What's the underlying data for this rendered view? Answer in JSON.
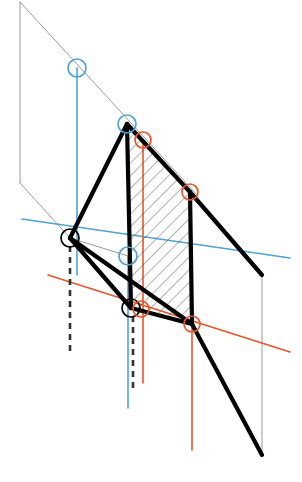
{
  "canvas": {
    "width": 302,
    "height": 482,
    "background": "#ffffff",
    "title": "Descriptive geometry projection diagram"
  },
  "palette": {
    "black": "#000000",
    "gray": "#808080",
    "blue": "#4da3d6",
    "orange": "#e8552a",
    "hatch": "#555555",
    "white": "#ffffff"
  },
  "strokes": {
    "thick": 4.2,
    "medium": 1.6,
    "thin": 1.0,
    "hairline": 0.8,
    "dashed_width": 2.6,
    "dash_pattern": "6 5"
  },
  "chart_data": {
    "type": "scatter",
    "xlabel": "",
    "ylabel": "",
    "xlim": [
      0,
      302
    ],
    "ylim": [
      0,
      482
    ],
    "grid": false,
    "legend": false,
    "markers": [
      {
        "id": "m1",
        "label": "blue-node-upper",
        "color": "#4da3d6",
        "x": 77,
        "y": 68,
        "r": 9
      },
      {
        "id": "m2",
        "label": "blue-node-quad-top-left",
        "color": "#4da3d6",
        "x": 127,
        "y": 124,
        "r": 9
      },
      {
        "id": "m3",
        "label": "orange-node-upper",
        "color": "#e8552a",
        "x": 143,
        "y": 140,
        "r": 8
      },
      {
        "id": "m4",
        "label": "orange-node-quad-top-right",
        "color": "#e8552a",
        "x": 190,
        "y": 192,
        "r": 8
      },
      {
        "id": "m5",
        "label": "black-node-apex-left",
        "color": "#000000",
        "x": 70,
        "y": 238,
        "r": 9
      },
      {
        "id": "m6",
        "label": "blue-node-mid",
        "color": "#4da3d6",
        "x": 128,
        "y": 256,
        "r": 9
      },
      {
        "id": "m7",
        "label": "black-node-lower-left",
        "color": "#000000",
        "x": 131,
        "y": 308,
        "r": 9
      },
      {
        "id": "m8",
        "label": "orange-node-lower-left",
        "color": "#e8552a",
        "x": 141,
        "y": 309,
        "r": 8
      },
      {
        "id": "m9",
        "label": "orange-node-quad-bottom-right",
        "color": "#e8552a",
        "x": 192,
        "y": 324,
        "r": 8
      }
    ],
    "quad_face": {
      "label": "hatched-quadrilateral-face",
      "points": "127,124 190,192 192,324 131,308",
      "hatch_angle_deg": 45,
      "hatch_spacing": 9
    },
    "thick_lines": [
      {
        "id": "t1",
        "label": "quad-edge-left",
        "x1": 127,
        "y1": 124,
        "x2": 131,
        "y2": 308
      },
      {
        "id": "t2",
        "label": "quad-edge-top",
        "x1": 127,
        "y1": 124,
        "x2": 190,
        "y2": 192
      },
      {
        "id": "t3",
        "label": "quad-edge-right",
        "x1": 190,
        "y1": 192,
        "x2": 192,
        "y2": 324
      },
      {
        "id": "t4",
        "label": "quad-edge-bottom",
        "x1": 131,
        "y1": 308,
        "x2": 192,
        "y2": 324
      },
      {
        "id": "t5",
        "label": "ray-apex-to-quad-top",
        "x1": 70,
        "y1": 238,
        "x2": 127,
        "y2": 124
      },
      {
        "id": "t6",
        "label": "ray-apex-to-lower-left",
        "x1": 70,
        "y1": 238,
        "x2": 131,
        "y2": 308
      },
      {
        "id": "t7",
        "label": "ray-apex-to-bottom-right",
        "x1": 70,
        "y1": 238,
        "x2": 192,
        "y2": 324
      },
      {
        "id": "t8",
        "label": "ray-extend-top-right",
        "x1": 190,
        "y1": 192,
        "x2": 262,
        "y2": 275
      },
      {
        "id": "t9",
        "label": "ray-extend-bottom-right",
        "x1": 192,
        "y1": 324,
        "x2": 262,
        "y2": 455
      }
    ],
    "thin_lines": [
      {
        "id": "g1",
        "label": "gray-vertical-left",
        "x1": 20,
        "y1": 2,
        "x2": 20,
        "y2": 183,
        "color": "#808080"
      },
      {
        "id": "g2",
        "label": "gray-sight-line-upper",
        "x1": 20,
        "y1": 2,
        "x2": 198,
        "y2": 196,
        "color": "#808080"
      },
      {
        "id": "g3",
        "label": "gray-sight-line-lower",
        "x1": 20,
        "y1": 183,
        "x2": 70,
        "y2": 238,
        "color": "#808080"
      },
      {
        "id": "g4",
        "label": "gray-vertical-right",
        "x1": 262,
        "y1": 275,
        "x2": 262,
        "y2": 455,
        "color": "#808080"
      },
      {
        "id": "g5",
        "label": "gray-chord-apex-to-mid",
        "x1": 70,
        "y1": 238,
        "x2": 131,
        "y2": 308,
        "color": "#808080"
      },
      {
        "id": "g6",
        "label": "gray-chord-apex-to-blue",
        "x1": 70,
        "y1": 238,
        "x2": 128,
        "y2": 256,
        "color": "#808080"
      },
      {
        "id": "g7",
        "label": "gray-chord-apex-to-orange",
        "x1": 70,
        "y1": 238,
        "x2": 192,
        "y2": 324,
        "color": "#808080"
      }
    ],
    "blue_lines": [
      {
        "id": "b1",
        "label": "blue-vertical-upper",
        "x1": 77,
        "y1": 68,
        "x2": 77,
        "y2": 275,
        "kind": "solid"
      },
      {
        "id": "b2",
        "label": "blue-vertical-mid",
        "x1": 128,
        "y1": 256,
        "x2": 128,
        "y2": 408,
        "kind": "solid"
      },
      {
        "id": "b3",
        "label": "blue-horizontal-axis",
        "x1": 22,
        "y1": 219,
        "x2": 290,
        "y2": 258,
        "kind": "solid"
      }
    ],
    "orange_lines": [
      {
        "id": "o1",
        "label": "orange-vertical-upper",
        "x1": 143,
        "y1": 140,
        "x2": 143,
        "y2": 383,
        "kind": "solid"
      },
      {
        "id": "o2",
        "label": "orange-vertical-lower",
        "x1": 192,
        "y1": 324,
        "x2": 192,
        "y2": 450,
        "kind": "solid"
      },
      {
        "id": "o3",
        "label": "orange-horizontal-axis",
        "x1": 48,
        "y1": 275,
        "x2": 290,
        "y2": 352,
        "kind": "solid"
      }
    ],
    "dashed_lines": [
      {
        "id": "d1",
        "label": "dashed-drop-left",
        "x1": 70,
        "y1": 246,
        "x2": 70,
        "y2": 352,
        "color": "#333333"
      },
      {
        "id": "d2",
        "label": "dashed-drop-mid",
        "x1": 133,
        "y1": 316,
        "x2": 133,
        "y2": 388,
        "color": "#333333"
      }
    ]
  }
}
